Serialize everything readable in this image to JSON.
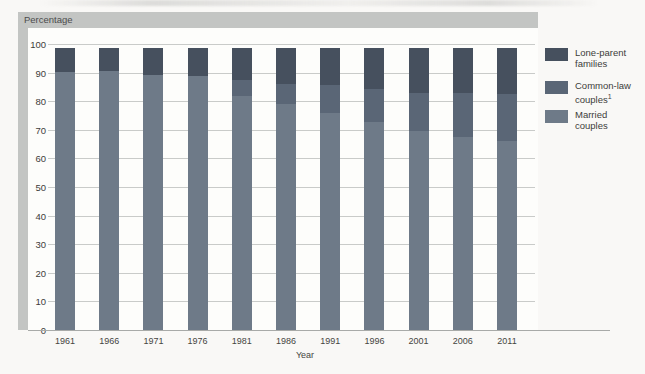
{
  "chart_data": {
    "type": "bar",
    "stacked": true,
    "title": "",
    "ylabel": "Percentage",
    "xlabel": "Year",
    "ylim": [
      0,
      100
    ],
    "yticks": [
      0,
      10,
      20,
      30,
      40,
      50,
      60,
      70,
      80,
      90,
      100
    ],
    "grid": true,
    "legend_position": "right",
    "categories": [
      "1961",
      "1966",
      "1971",
      "1976",
      "1981",
      "1986",
      "1991",
      "1996",
      "2001",
      "2006",
      "2011"
    ],
    "series": [
      {
        "name": "Married couples",
        "color": "#6e7a88",
        "values": [
          91.6,
          91.8,
          90.6,
          90.2,
          83.1,
          80.2,
          77.2,
          73.8,
          70.5,
          68.6,
          67.0
        ]
      },
      {
        "name": "Common-law couples",
        "footnote": "1",
        "color": "#5a6676",
        "values": [
          0,
          0,
          0,
          0,
          5.6,
          7.2,
          9.9,
          11.7,
          13.8,
          15.5,
          16.7
        ]
      },
      {
        "name": "Lone-parent families",
        "color": "#46505e",
        "values": [
          8.4,
          8.2,
          9.4,
          9.8,
          11.3,
          12.6,
          12.9,
          14.5,
          15.7,
          15.9,
          16.3
        ]
      }
    ],
    "legend": [
      {
        "series": "Lone-parent families",
        "lines": [
          "Lone-parent",
          "families"
        ],
        "footnote": "",
        "color": "#46505e"
      },
      {
        "series": "Common-law couples",
        "lines": [
          "Common-law",
          "couples"
        ],
        "footnote": "1",
        "color": "#5a6676"
      },
      {
        "series": "Married couples",
        "lines": [
          "Married",
          "couples"
        ],
        "footnote": "",
        "color": "#6e7a88"
      }
    ],
    "colors": {
      "band_gray": "#c3c5c3",
      "plot_background": "#fdfdfb",
      "gridline": "#c9cbc9",
      "axis_line": "#a8aaa8"
    }
  }
}
